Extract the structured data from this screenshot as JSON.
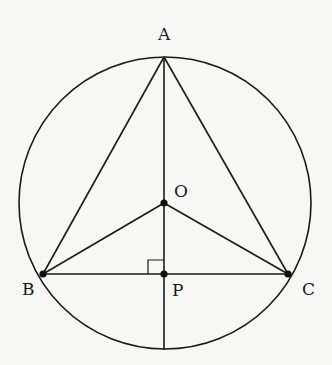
{
  "diagram": {
    "type": "circle-geometry",
    "circle": {
      "center_label": "O"
    },
    "points": {
      "A": {
        "label": "A"
      },
      "B": {
        "label": "B"
      },
      "C": {
        "label": "C"
      },
      "O": {
        "label": "O"
      },
      "P": {
        "label": "P"
      }
    },
    "segments": [
      "AB",
      "AC",
      "BC",
      "OB",
      "OC",
      "AO",
      "OP",
      "P-to-circle"
    ],
    "annotations": {
      "right_angle_at": "P"
    },
    "colors": {
      "stroke": "#1a1a1a",
      "background": "#f7f7f5"
    }
  }
}
